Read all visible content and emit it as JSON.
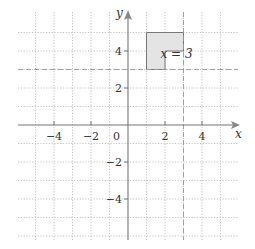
{
  "diagram": {
    "type": "coordinate-grid",
    "x_axis": {
      "label": "x",
      "ticks": [
        "-4",
        "-2",
        "0",
        "2",
        "4"
      ],
      "range": [
        -6,
        6
      ]
    },
    "y_axis": {
      "label": "y",
      "ticks": [
        "4",
        "2",
        "-2",
        "-4"
      ],
      "range": [
        -6,
        6
      ]
    },
    "grid": {
      "style": "dotted",
      "spacing": 1
    },
    "shape": {
      "name": "L-shape",
      "fill": "#e4e4e4",
      "stroke": "#777777",
      "vertices": [
        [
          1,
          5
        ],
        [
          3,
          5
        ],
        [
          3,
          4
        ],
        [
          2,
          4
        ],
        [
          2,
          3
        ],
        [
          1,
          3
        ]
      ]
    },
    "mirror_lines": [
      {
        "label": "x = 3",
        "orientation": "vertical",
        "value": 3,
        "style": "dashed"
      },
      {
        "label": "",
        "orientation": "horizontal",
        "value": 3,
        "style": "dashed"
      }
    ]
  }
}
